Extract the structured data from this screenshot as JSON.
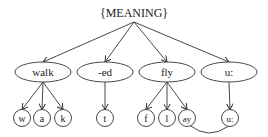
{
  "diagram": {
    "root": {
      "label": "{MEANING}",
      "x": 134,
      "y": 17
    },
    "morphemes": [
      {
        "id": "walk",
        "label": "walk",
        "cx": 43,
        "cy": 72
      },
      {
        "id": "ed",
        "label": "-ed",
        "cx": 105,
        "cy": 72
      },
      {
        "id": "fly",
        "label": "fly",
        "cx": 167,
        "cy": 72
      },
      {
        "id": "u",
        "label": "u:",
        "cx": 229,
        "cy": 72
      }
    ],
    "phonemes": [
      {
        "label": "w",
        "parent": "walk",
        "cx": 22,
        "cy": 118
      },
      {
        "label": "a",
        "parent": "walk",
        "cx": 42,
        "cy": 118
      },
      {
        "label": "k",
        "parent": "walk",
        "cx": 63,
        "cy": 118
      },
      {
        "label": "t",
        "parent": "ed",
        "cx": 105,
        "cy": 118
      },
      {
        "label": "f",
        "parent": "fly",
        "cx": 146,
        "cy": 118
      },
      {
        "label": "l",
        "parent": "fly",
        "cx": 167,
        "cy": 118
      },
      {
        "label": "ay",
        "parent": "fly",
        "cx": 187,
        "cy": 118
      },
      {
        "label": "u:",
        "parent": "u",
        "cx": 230,
        "cy": 118
      }
    ],
    "links": [
      {
        "from": "ay",
        "to": "u:",
        "type": "curved-connector"
      }
    ],
    "colors": {
      "stroke": "#333333",
      "text": "#222222",
      "background": "#ffffff"
    }
  }
}
